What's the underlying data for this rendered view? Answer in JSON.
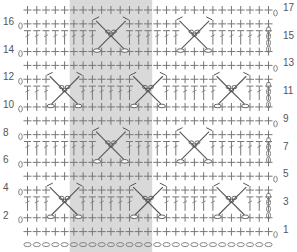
{
  "chart_title": "",
  "stitch_chart": {
    "columns": 27,
    "rows": 17,
    "foundation": "chain",
    "shaded_repeat": {
      "from_col": 5,
      "to_col": 13,
      "color": "#d9d9d9"
    },
    "grid_color": "#777777",
    "motif_color": "#555555",
    "left_row_labels": [
      {
        "label": "16",
        "row": 16
      },
      {
        "label": "14",
        "row": 14
      },
      {
        "label": "12",
        "row": 12
      },
      {
        "label": "10",
        "row": 10
      },
      {
        "label": "8",
        "row": 8
      },
      {
        "label": "6",
        "row": 6
      },
      {
        "label": "4",
        "row": 4
      },
      {
        "label": "2",
        "row": 2
      }
    ],
    "right_row_labels": [
      {
        "label": "17",
        "row": 17
      },
      {
        "label": "15",
        "row": 15
      },
      {
        "label": "13",
        "row": 13
      },
      {
        "label": "11",
        "row": 11
      },
      {
        "label": "9",
        "row": 9
      },
      {
        "label": "7",
        "row": 7
      },
      {
        "label": "5",
        "row": 5
      },
      {
        "label": "3",
        "row": 3
      },
      {
        "label": "1",
        "row": 1
      }
    ],
    "motifs": [
      {
        "rows": [
          14,
          16
        ],
        "center_cols": [
          9,
          18
        ]
      },
      {
        "rows": [
          10,
          12
        ],
        "center_cols": [
          4,
          13,
          22
        ]
      },
      {
        "rows": [
          6,
          8
        ],
        "center_cols": [
          9,
          18
        ]
      },
      {
        "rows": [
          2,
          4
        ],
        "center_cols": [
          4,
          13,
          22
        ]
      }
    ],
    "legend": {
      "plus": "single crochet",
      "tall_bar": "double crochet",
      "oval": "chain",
      "crossed": "crossed stitch motif"
    }
  }
}
